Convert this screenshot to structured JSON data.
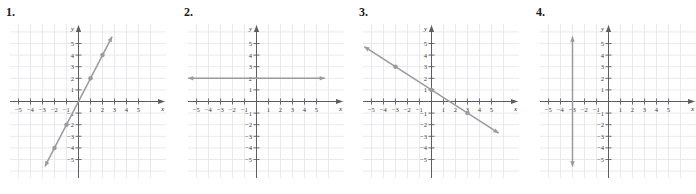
{
  "page": {
    "background": "#ffffff",
    "width": 696,
    "height": 194,
    "panel_count": 4
  },
  "style": {
    "grid_color": "#e7e7ea",
    "axis_color": "#5d5d62",
    "line_color": "#9a9aa2",
    "point_color": "#9a9aa2",
    "label_color": "#3a3a3a"
  },
  "axis_labels": {
    "x_name": "x",
    "y_name": "y",
    "x_ticks": [
      "-5",
      "-4",
      "-3",
      "-2",
      "-1",
      "1",
      "2",
      "3",
      "4",
      "5"
    ],
    "y_ticks": [
      "5",
      "4",
      "3",
      "2",
      "1",
      "-1",
      "-2",
      "-3",
      "-4",
      "-5"
    ]
  },
  "panels": [
    {
      "label": "1.",
      "name": "graph-panel-1",
      "chart_data": {
        "type": "line",
        "title": "1.",
        "xlabel": "x",
        "ylabel": "y",
        "xlim": [
          -6,
          6
        ],
        "ylim": [
          -6,
          6
        ],
        "grid": true,
        "legend": "none",
        "series": [
          {
            "name": "y = 2x",
            "slope": 2,
            "intercept": 0,
            "x": [
              -2.8,
              2.8
            ],
            "y": [
              -5.6,
              5.6
            ],
            "arrows": [
              "start",
              "end"
            ],
            "points": [
              {
                "x": -2,
                "y": -4
              },
              {
                "x": -1,
                "y": -2
              },
              {
                "x": 1,
                "y": 2
              },
              {
                "x": 2,
                "y": 4
              }
            ]
          }
        ]
      }
    },
    {
      "label": "2.",
      "name": "graph-panel-2",
      "chart_data": {
        "type": "line",
        "title": "2.",
        "xlabel": "x",
        "ylabel": "y",
        "xlim": [
          -6,
          6
        ],
        "ylim": [
          -6,
          6
        ],
        "grid": true,
        "legend": "none",
        "series": [
          {
            "name": "y = 2",
            "slope": 0,
            "intercept": 2,
            "x": [
              -5.7,
              5.7
            ],
            "y": [
              2,
              2
            ],
            "arrows": [
              "start",
              "end"
            ],
            "points": []
          }
        ]
      }
    },
    {
      "label": "3.",
      "name": "graph-panel-3",
      "chart_data": {
        "type": "line",
        "title": "3.",
        "xlabel": "x",
        "ylabel": "y",
        "xlim": [
          -6,
          6
        ],
        "ylim": [
          -6,
          6
        ],
        "grid": true,
        "legend": "none",
        "series": [
          {
            "name": "y = -2x/3 + 1",
            "slope": -0.6667,
            "intercept": 1,
            "x": [
              -5.6,
              5.6
            ],
            "y": [
              4.73,
              -2.73
            ],
            "arrows": [
              "start",
              "end"
            ],
            "points": [
              {
                "x": -3,
                "y": 3
              },
              {
                "x": 0,
                "y": 1
              },
              {
                "x": 3,
                "y": -1
              }
            ]
          }
        ]
      }
    },
    {
      "label": "4.",
      "name": "graph-panel-4",
      "chart_data": {
        "type": "line",
        "title": "4.",
        "xlabel": "x",
        "ylabel": "y",
        "xlim": [
          -6,
          6
        ],
        "ylim": [
          -6,
          6
        ],
        "grid": true,
        "legend": "none",
        "series": [
          {
            "name": "x = -3",
            "slope": null,
            "intercept": null,
            "x": [
              -3,
              -3
            ],
            "y": [
              -5.6,
              5.6
            ],
            "arrows": [
              "start",
              "end"
            ],
            "points": []
          }
        ]
      }
    }
  ]
}
